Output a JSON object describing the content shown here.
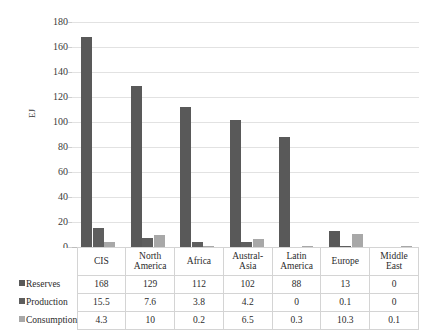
{
  "chart_data": {
    "type": "bar",
    "title": "",
    "xlabel": "",
    "ylabel": "EJ",
    "ylim": [
      0,
      180
    ],
    "ytick_step": 20,
    "yticks": [
      180,
      160,
      140,
      120,
      100,
      80,
      60,
      40,
      20,
      0
    ],
    "grid": true,
    "legend_position": "data-table-left",
    "categories": [
      "CIS",
      "North America",
      "Africa",
      "Austral-Asia",
      "Latin America",
      "Europe",
      "Middle East"
    ],
    "category_lines": [
      [
        "CIS"
      ],
      [
        "North",
        "America"
      ],
      [
        "Africa"
      ],
      [
        "Austral-",
        "Asia"
      ],
      [
        "Latin",
        "America"
      ],
      [
        "Europe"
      ],
      [
        "Middle",
        "East"
      ]
    ],
    "series": [
      {
        "name": "Reserves",
        "color": "#595959",
        "values": [
          168,
          129,
          112,
          102,
          88,
          13,
          0
        ],
        "labels": [
          "168",
          "129",
          "112",
          "102",
          "88",
          "13",
          "0"
        ]
      },
      {
        "name": "Production",
        "color": "#5e5e5e",
        "values": [
          15.5,
          7.6,
          3.8,
          4.2,
          0,
          0.1,
          0
        ],
        "labels": [
          "15.5",
          "7.6",
          "3.8",
          "4.2",
          "0",
          "0.1",
          "0"
        ]
      },
      {
        "name": "Consumption",
        "color": "#a8a8a8",
        "values": [
          4.3,
          10,
          0.2,
          6.5,
          0.3,
          10.3,
          0.1
        ],
        "labels": [
          "4.3",
          "10",
          "0.2",
          "6.5",
          "0.3",
          "10.3",
          "0.1"
        ]
      }
    ]
  },
  "colors": {
    "reserves": "#595959",
    "production": "#5e5e5e",
    "consumption": "#a8a8a8",
    "gridline": "#e2e2e2",
    "table_border": "#d4d4d4"
  }
}
